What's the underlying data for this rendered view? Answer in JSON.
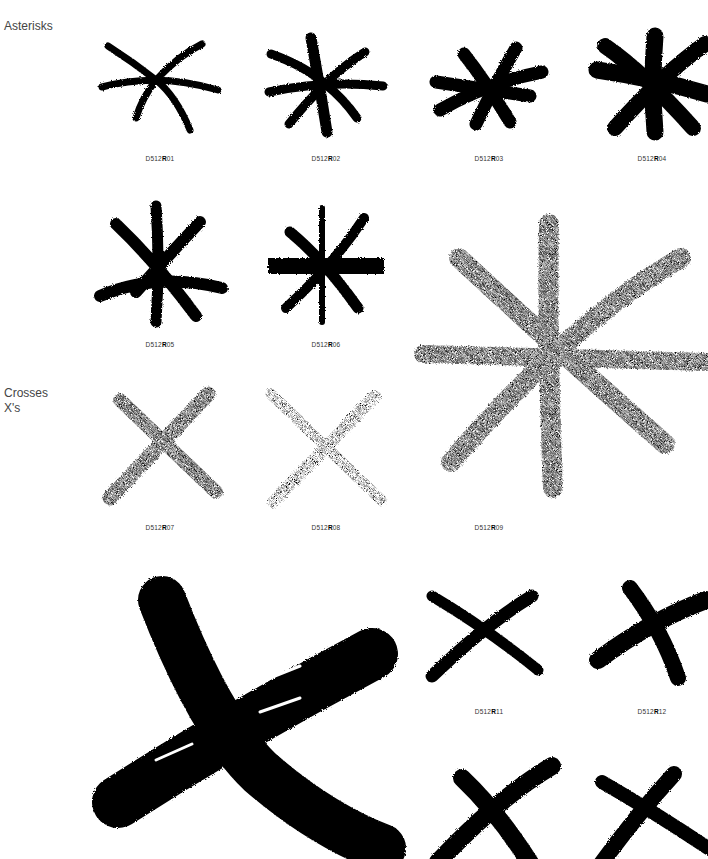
{
  "sections": [
    {
      "label": "Asterisks"
    },
    {
      "label": "Crosses",
      "sublabel": "X's"
    }
  ],
  "code_prefix": "D512",
  "code_letter": "R",
  "items": [
    {
      "id": "01",
      "code_suffix": "01",
      "type": "asterisk",
      "style": "brush"
    },
    {
      "id": "02",
      "code_suffix": "02",
      "type": "asterisk",
      "style": "brush"
    },
    {
      "id": "03",
      "code_suffix": "03",
      "type": "asterisk",
      "style": "brush-heavy"
    },
    {
      "id": "04",
      "code_suffix": "04",
      "type": "asterisk",
      "style": "brush-heavy"
    },
    {
      "id": "05",
      "code_suffix": "05",
      "type": "asterisk",
      "style": "brush"
    },
    {
      "id": "06",
      "code_suffix": "06",
      "type": "asterisk",
      "style": "brush"
    },
    {
      "id": "07",
      "code_suffix": "07",
      "type": "cross",
      "style": "crayon"
    },
    {
      "id": "08",
      "code_suffix": "08",
      "type": "cross",
      "style": "crayon-light"
    },
    {
      "id": "09",
      "code_suffix": "09",
      "type": "asterisk",
      "style": "crayon-large"
    },
    {
      "id": "10",
      "code_suffix": "10",
      "type": "cross",
      "style": "brush-large"
    },
    {
      "id": "11",
      "code_suffix": "11",
      "type": "cross",
      "style": "brush"
    },
    {
      "id": "12",
      "code_suffix": "12",
      "type": "cross",
      "style": "brush"
    },
    {
      "id": "13",
      "code_suffix": "13",
      "type": "cross",
      "style": "brush"
    },
    {
      "id": "14",
      "code_suffix": "14",
      "type": "cross",
      "style": "brush"
    }
  ],
  "colors": {
    "ink": "#000000",
    "label": "#444444",
    "background": "#ffffff"
  }
}
